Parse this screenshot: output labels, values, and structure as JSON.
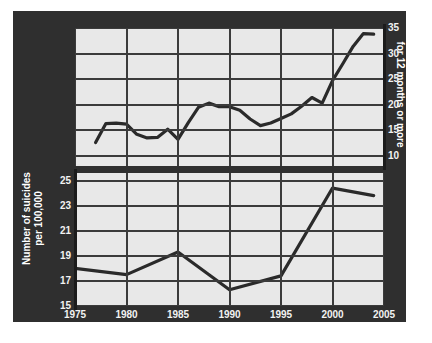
{
  "chart_data": [
    {
      "type": "line",
      "id": "unemployment",
      "title": "",
      "position": "top",
      "xlabel": "Year",
      "ylabel": "Percent of total unemployed for 12 months or more",
      "ylabel_lines": [
        "Percent of total unemployed",
        "for 12 months or more"
      ],
      "y_axis_side": "right",
      "xlim": [
        1975,
        2005
      ],
      "ylim": [
        8,
        35
      ],
      "ytick_labels": [
        "35",
        "30",
        "25",
        "20",
        "15",
        "10"
      ],
      "yticks": [
        35,
        30,
        25,
        20,
        15,
        10
      ],
      "xtick_labels": [
        "1975",
        "1980",
        "1985",
        "1990",
        "1995",
        "2000",
        "2005"
      ],
      "xticks": [
        1975,
        1980,
        1985,
        1990,
        1995,
        2000,
        2005
      ],
      "grid": true,
      "legend": "none",
      "x": [
        1977,
        1978,
        1979,
        1980,
        1981,
        1982,
        1983,
        1984,
        1985,
        1986,
        1987,
        1988,
        1989,
        1990,
        1991,
        1992,
        1993,
        1994,
        1995,
        1996,
        1997,
        1998,
        1999,
        2000,
        2001,
        2002,
        2003,
        2004
      ],
      "values": [
        12.6,
        16.3,
        16.4,
        16.2,
        14.2,
        13.5,
        13.6,
        15.2,
        13.2,
        16.5,
        19.5,
        20.3,
        19.6,
        19.6,
        18.9,
        17.2,
        15.9,
        16.4,
        17.3,
        18.2,
        19.7,
        21.4,
        20.3,
        24.7,
        28.0,
        31.4,
        33.9,
        33.8
      ]
    },
    {
      "type": "line",
      "id": "suicides",
      "title": "",
      "position": "bottom",
      "xlabel": "Year",
      "ylabel": "Number of suicides per 100,000",
      "ylabel_lines": [
        "Number of suicides",
        "per 100,000"
      ],
      "y_axis_side": "left",
      "xlim": [
        1975,
        2005
      ],
      "ylim": [
        15,
        25.6
      ],
      "ytick_labels": [
        "25",
        "23",
        "21",
        "19",
        "17",
        "15"
      ],
      "yticks": [
        25,
        23,
        21,
        19,
        17,
        15
      ],
      "xtick_labels": [
        "1975",
        "1980",
        "1985",
        "1990",
        "1995",
        "2000",
        "2005"
      ],
      "xticks": [
        1975,
        1980,
        1985,
        1990,
        1995,
        2000,
        2005
      ],
      "grid": true,
      "legend": "none",
      "x": [
        1975,
        1980,
        1985,
        1990,
        1995,
        2000,
        2004
      ],
      "values": [
        18.0,
        17.5,
        19.3,
        16.3,
        17.4,
        24.4,
        23.8
      ]
    }
  ],
  "labels": {
    "xlabel": "Year",
    "ylabel_left_line1": "Number of suicides",
    "ylabel_left_line2": "per 100,000",
    "ylabel_right_line1": "Percent of total unemployed",
    "ylabel_right_line2": "for 12 months or more"
  },
  "ticks": {
    "x": [
      "1975",
      "1980",
      "1985",
      "1990",
      "1995",
      "2000",
      "2005"
    ],
    "y_left": [
      "25",
      "23",
      "21",
      "19",
      "17",
      "15"
    ],
    "y_right": [
      "35",
      "30",
      "25",
      "20",
      "15",
      "10"
    ]
  },
  "colors": {
    "panel_background": "#2f2f2f",
    "plot_background": "#e8e8e8",
    "line": "#2a2a2a",
    "grid": "#3b3b3b",
    "text": "#f2f2f2",
    "page_background": "#ffffff"
  }
}
